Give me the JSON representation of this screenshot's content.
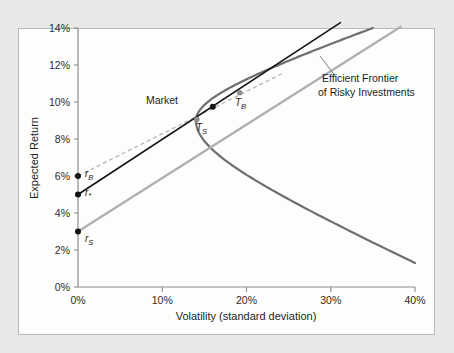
{
  "chart_data": {
    "type": "line",
    "title": "",
    "xlabel": "Volatility (standard deviation)",
    "ylabel": "Expected Return",
    "xlim": [
      0,
      40
    ],
    "ylim": [
      0,
      14
    ],
    "xticks": [
      "0%",
      "10%",
      "20%",
      "30%",
      "40%"
    ],
    "xtick_values": [
      0,
      10,
      20,
      30,
      40
    ],
    "yticks": [
      "0%",
      "2%",
      "4%",
      "6%",
      "8%",
      "10%",
      "12%",
      "14%"
    ],
    "ytick_values": [
      0,
      2,
      4,
      6,
      8,
      10,
      12,
      14
    ],
    "grid": false,
    "legend_position": "none",
    "annotations": [
      {
        "name": "efficient-frontier-callout",
        "text_line_1": "Efficient Frontier",
        "text_line_2": "of Risky Investments",
        "x": 31.0,
        "y": 11.9
      },
      {
        "name": "market-label",
        "text": "Market",
        "x": 13.0,
        "y": 10.0
      },
      {
        "name": "tangency-borrow-label",
        "text": "T",
        "sub": "B",
        "x": 20.2,
        "y": 10.1
      },
      {
        "name": "tangency-save-label",
        "text": "T",
        "sub": "S",
        "x": 15.3,
        "y": 8.6
      },
      {
        "name": "borrow-rate-label",
        "text": "r",
        "sub": "B",
        "x": 0.9,
        "y": 5.55
      },
      {
        "name": "star-rate-label",
        "text": "r",
        "sub": "*",
        "x": 0.9,
        "y": 4.55
      },
      {
        "name": "save-rate-label",
        "text": "r",
        "sub": "S",
        "x": 0.9,
        "y": 2.5
      }
    ],
    "series": [
      {
        "name": "Efficient Frontier of Risky Investments",
        "type": "hyperbola",
        "color": "#6e6e6e",
        "style": "solid",
        "width": 2.2,
        "min_variance_point": {
          "x": 14.0,
          "y": 9.0
        },
        "upper_branch_end": {
          "x": 35.0,
          "y": 14.0
        },
        "lower_branch_end": {
          "x": 40.0,
          "y": 1.3
        }
      },
      {
        "name": "Capital allocation line at borrowing rate",
        "type": "line",
        "color": "#b5b5b5",
        "style": "dashed",
        "width": 1.3,
        "start": {
          "x": 0.0,
          "y": 6.0
        },
        "end": {
          "x": 24.5,
          "y": 11.6
        },
        "tangency": {
          "x": 14.0,
          "y": 9.0
        }
      },
      {
        "name": "Capital allocation line at blended rate",
        "type": "line",
        "color": "#141414",
        "style": "solid",
        "width": 1.6,
        "start": {
          "x": 0.0,
          "y": 5.0
        },
        "end": {
          "x": 31.2,
          "y": 14.3
        },
        "tangency": {
          "x": 16.0,
          "y": 9.75
        }
      },
      {
        "name": "Capital allocation line at saving rate",
        "type": "line",
        "color": "#b0b0b0",
        "style": "solid",
        "width": 2.4,
        "start": {
          "x": 0.0,
          "y": 3.0
        },
        "end": {
          "x": 38.4,
          "y": 14.1
        },
        "tangency": {
          "x": 19.2,
          "y": 8.6
        }
      }
    ],
    "points": [
      {
        "name": "borrow-rate-intercept",
        "label": "r_B",
        "x": 0.0,
        "y": 6.0,
        "color": "#141414",
        "r": 3.0
      },
      {
        "name": "star-rate-intercept",
        "label": "r*",
        "x": 0.0,
        "y": 5.0,
        "color": "#141414",
        "r": 3.0
      },
      {
        "name": "save-rate-intercept",
        "label": "r_S",
        "x": 0.0,
        "y": 3.0,
        "color": "#141414",
        "r": 3.0
      },
      {
        "name": "market-point",
        "label": "Market",
        "x": 16.0,
        "y": 9.75,
        "color": "#141414",
        "r": 3.0
      },
      {
        "name": "tangency-save-point",
        "label": "T_S",
        "x": 14.1,
        "y": 9.05,
        "color": "#8e8e8e",
        "r": 2.8
      },
      {
        "name": "tangency-borrow-point",
        "label": "T_B",
        "x": 19.2,
        "y": 10.5,
        "color": "#8e8e8e",
        "r": 2.8
      }
    ]
  },
  "axes": {
    "x_title": "Volatility (standard deviation)",
    "y_title": "Expected Return"
  },
  "colors": {
    "frontier": "#6e6e6e",
    "cal_black": "#141414",
    "cal_gray": "#b0b0b0",
    "cal_dashed": "#b5b5b5",
    "axis": "#8c8c8c",
    "frame_border": "#b9b8b6",
    "page_background": "#e9e8e6",
    "plot_background": "#fdfdfc"
  }
}
